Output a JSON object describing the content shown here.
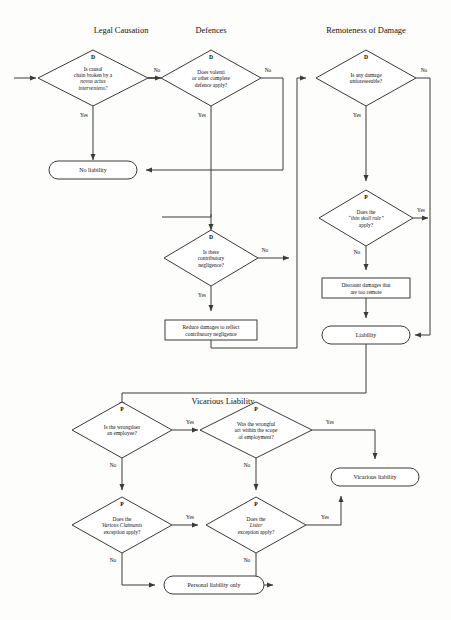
{
  "diagram": {
    "background_color": "#fdfdfb",
    "line_color": "#3a3a3a"
  },
  "sections": [
    {
      "id": "legal-causation",
      "label": "Legal Causation",
      "x": 121,
      "y": 33
    },
    {
      "id": "defences",
      "label": "Defences",
      "x": 211,
      "y": 33
    },
    {
      "id": "remoteness",
      "label": "Remoteness of Damage",
      "x": 366,
      "y": 33
    },
    {
      "id": "vicarious",
      "label": "Vicarious Liability",
      "x": 223,
      "y": 401
    }
  ],
  "decisions": [
    {
      "id": "causation",
      "badge": "D",
      "lines": [
        {
          "text": "Is causal",
          "italic": false
        },
        {
          "text": "chain broken by a",
          "italic": false
        },
        {
          "text": "novus actus",
          "italic": true
        },
        {
          "text": "interveniens?",
          "italic": true
        }
      ],
      "cx": 93,
      "cy": 78,
      "rx": 55,
      "ry": 28
    },
    {
      "id": "volenti",
      "badge": "D",
      "lines": [
        {
          "text": "Does volenti",
          "italic": false
        },
        {
          "text": "or other complete",
          "italic": false
        },
        {
          "text": "defence apply?",
          "italic": false
        }
      ],
      "cx": 211,
      "cy": 78,
      "rx": 50,
      "ry": 28
    },
    {
      "id": "unforeseeable",
      "badge": "D",
      "lines": [
        {
          "text": "Is any damage",
          "italic": false
        },
        {
          "text": "unforeseeable?",
          "italic": false
        }
      ],
      "cx": 366,
      "cy": 78,
      "rx": 50,
      "ry": 28
    },
    {
      "id": "contributory",
      "badge": "D",
      "lines": [
        {
          "text": "Is there",
          "italic": false
        },
        {
          "text": "contributory",
          "italic": false
        },
        {
          "text": "negligence?",
          "italic": false
        }
      ],
      "cx": 211,
      "cy": 258,
      "rx": 47,
      "ry": 28
    },
    {
      "id": "thin-skull",
      "badge": "P",
      "lines": [
        {
          "text": "Does the",
          "italic": false
        },
        {
          "text": "“thin skull rule”",
          "italic": true
        },
        {
          "text": "apply?",
          "italic": false
        }
      ],
      "cx": 366,
      "cy": 218,
      "rx": 47,
      "ry": 28
    },
    {
      "id": "employee",
      "badge": "P",
      "lines": [
        {
          "text": "Is the wrongdoer",
          "italic": false
        },
        {
          "text": "an employee?",
          "italic": false
        }
      ],
      "cx": 122,
      "cy": 430,
      "rx": 50,
      "ry": 28
    },
    {
      "id": "scope",
      "badge": "P",
      "lines": [
        {
          "text": "Was the wrongful",
          "italic": false
        },
        {
          "text": "act within the scope",
          "italic": false
        },
        {
          "text": "of employment?",
          "italic": false
        }
      ],
      "cx": 256,
      "cy": 430,
      "rx": 56,
      "ry": 28
    },
    {
      "id": "various-claimants",
      "badge": "P",
      "lines": [
        {
          "text": "Does the",
          "italic": false
        },
        {
          "text": "Various Claimants",
          "italic": true
        },
        {
          "text": "exception apply?",
          "italic": false
        }
      ],
      "cx": 122,
      "cy": 525,
      "rx": 50,
      "ry": 28
    },
    {
      "id": "lister",
      "badge": "P",
      "lines": [
        {
          "text": "Does the",
          "italic": false
        },
        {
          "text": "Lister",
          "italic": true
        },
        {
          "text": "exception apply?",
          "italic": false
        }
      ],
      "cx": 256,
      "cy": 525,
      "rx": 50,
      "ry": 28
    }
  ],
  "processes": [
    {
      "id": "reduce-damages",
      "lines": [
        "Reduce damages to reflect",
        "contributory negligence"
      ],
      "x": 165,
      "y": 320,
      "w": 92,
      "h": 20
    },
    {
      "id": "discount-damages",
      "lines": [
        "Discount damages that",
        "are too remote"
      ],
      "x": 322,
      "y": 278,
      "w": 88,
      "h": 20
    }
  ],
  "terminals": [
    {
      "id": "no-liability",
      "label": "No liability",
      "cx": 93,
      "cy": 170,
      "w": 88,
      "h": 18
    },
    {
      "id": "liability",
      "label": "Liability",
      "cx": 366,
      "cy": 335,
      "w": 88,
      "h": 18
    },
    {
      "id": "vicarious-liability",
      "label": "Vicarious liability",
      "cx": 375,
      "cy": 477,
      "w": 88,
      "h": 18
    },
    {
      "id": "personal-liability",
      "label": "Personal liability only",
      "cx": 214,
      "cy": 585,
      "w": 100,
      "h": 18
    }
  ],
  "edge_labels": [
    {
      "id": "causation-no",
      "text": "No",
      "x": 157,
      "y": 72
    },
    {
      "id": "causation-yes",
      "text": "Yes",
      "x": 84,
      "y": 117
    },
    {
      "id": "volenti-no",
      "text": "No",
      "x": 268,
      "y": 72
    },
    {
      "id": "volenti-yes",
      "text": "Yes",
      "x": 202,
      "y": 117
    },
    {
      "id": "unforeseeable-no",
      "text": "No",
      "x": 424,
      "y": 72
    },
    {
      "id": "unforeseeable-yes",
      "text": "Yes",
      "x": 357,
      "y": 117
    },
    {
      "id": "thin-skull-yes",
      "text": "Yes",
      "x": 421,
      "y": 212
    },
    {
      "id": "thin-skull-no",
      "text": "No",
      "x": 357,
      "y": 254
    },
    {
      "id": "contributory-no",
      "text": "No",
      "x": 265,
      "y": 252
    },
    {
      "id": "contributory-yes",
      "text": "Yes",
      "x": 202,
      "y": 297
    },
    {
      "id": "employee-yes",
      "text": "Yes",
      "x": 190,
      "y": 424
    },
    {
      "id": "employee-no",
      "text": "No",
      "x": 113,
      "y": 467
    },
    {
      "id": "scope-yes",
      "text": "Yes",
      "x": 330,
      "y": 424
    },
    {
      "id": "scope-no",
      "text": "No",
      "x": 247,
      "y": 467
    },
    {
      "id": "various-yes",
      "text": "Yes",
      "x": 190,
      "y": 519
    },
    {
      "id": "various-no",
      "text": "No",
      "x": 113,
      "y": 562
    },
    {
      "id": "lister-yes",
      "text": "Yes",
      "x": 325,
      "y": 519
    },
    {
      "id": "lister-no",
      "text": "No",
      "x": 247,
      "y": 562
    }
  ],
  "flow": {
    "entry_note": "Incoming arrow from left into the Legal Causation decision"
  }
}
